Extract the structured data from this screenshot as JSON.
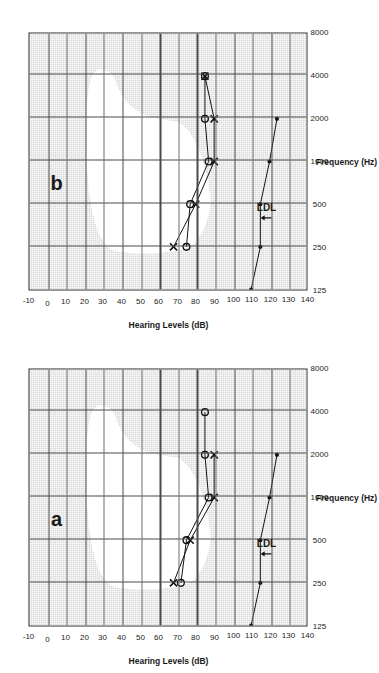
{
  "figure": {
    "panels": [
      {
        "id": "a",
        "label": "a"
      },
      {
        "id": "b",
        "label": "b"
      }
    ]
  },
  "axes": {
    "x_title": "Frequency (Hz)",
    "y_title": "Hearing Levels (dB)",
    "x_ticks": [
      "125",
      "250",
      "500",
      "1000",
      "2000",
      "4000",
      "8000"
    ],
    "y_ticks": [
      "-10",
      "0",
      "10",
      "20",
      "30",
      "40",
      "50",
      "60",
      "70",
      "80",
      "90",
      "100",
      "110",
      "120",
      "130",
      "140"
    ],
    "x_values": [
      125,
      250,
      500,
      1000,
      2000,
      4000,
      8000
    ],
    "y_values": [
      -10,
      0,
      10,
      20,
      30,
      40,
      50,
      60,
      70,
      80,
      90,
      100,
      110,
      120,
      130,
      140
    ],
    "ylim": [
      -10,
      140
    ],
    "xlim_index": [
      0,
      6
    ]
  },
  "annotations": {
    "ldl_label": "LDL"
  },
  "colors": {
    "plot_background": "#d9d9d9",
    "banana_fill": "#ffffff",
    "grid": "#4a4a4a",
    "marker": "#111111",
    "axis_text": "#1a1a1a"
  },
  "chart_data": [
    {
      "type": "line",
      "title": "a",
      "xlabel": "Frequency (Hz)",
      "ylabel": "Hearing Levels (dB)",
      "x": [
        125,
        250,
        500,
        1000,
        2000,
        4000,
        8000
      ],
      "xscale": "log",
      "ylim": [
        -10,
        140
      ],
      "y_inverted": true,
      "grid": true,
      "legend": "none",
      "series": [
        {
          "name": "Right ear air conduction (O)",
          "marker": "circle",
          "x": [
            250,
            500,
            1000,
            2000,
            4000
          ],
          "values": [
            72,
            75,
            87,
            85,
            85
          ]
        },
        {
          "name": "Left ear air conduction (X)",
          "marker": "cross",
          "x": [
            250,
            500,
            1000,
            2000
          ],
          "values": [
            68,
            77,
            90,
            90
          ]
        },
        {
          "name": "LDL",
          "marker": "dot",
          "x": [
            125,
            250,
            500,
            1000,
            2000
          ],
          "values": [
            110,
            115,
            115,
            120,
            124
          ]
        }
      ],
      "annotations": [
        {
          "text": "LDL",
          "x": 400,
          "y": 118
        }
      ],
      "shaded_region": {
        "name": "speech banana",
        "fill": "#ffffff",
        "approx_db_range": [
          20,
          80
        ]
      }
    },
    {
      "type": "line",
      "title": "b",
      "xlabel": "Frequency (Hz)",
      "ylabel": "Hearing Levels (dB)",
      "x": [
        125,
        250,
        500,
        1000,
        2000,
        4000,
        8000
      ],
      "xscale": "log",
      "ylim": [
        -10,
        140
      ],
      "y_inverted": true,
      "grid": true,
      "legend": "none",
      "series": [
        {
          "name": "Right ear air conduction (O)",
          "marker": "circle",
          "x": [
            250,
            500,
            1000,
            2000,
            4000
          ],
          "values": [
            75,
            77,
            87,
            85,
            85
          ]
        },
        {
          "name": "Left ear air conduction (X)",
          "marker": "cross",
          "x": [
            250,
            500,
            1000,
            2000,
            4000
          ],
          "values": [
            68,
            80,
            90,
            90,
            85
          ]
        },
        {
          "name": "LDL",
          "marker": "dot",
          "x": [
            125,
            250,
            500,
            1000,
            2000
          ],
          "values": [
            110,
            115,
            115,
            120,
            124
          ]
        }
      ],
      "annotations": [
        {
          "text": "LDL",
          "x": 400,
          "y": 118
        }
      ],
      "shaded_region": {
        "name": "speech banana",
        "fill": "#ffffff",
        "approx_db_range": [
          20,
          80
        ]
      }
    }
  ]
}
